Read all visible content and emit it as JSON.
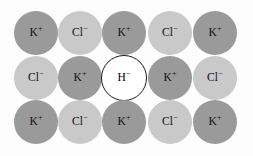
{
  "figure": {
    "width": 253,
    "height": 156,
    "background_color": "#fdfdfd"
  },
  "colors": {
    "cation_fill": "#9a9a9a",
    "anion_fill": "#c9c9c9",
    "defect_fill": "#ffffff",
    "defect_stroke": "#1a1a1a",
    "label_color": "#111111"
  },
  "species": {
    "potassium": {
      "symbol": "K",
      "charge": "+",
      "kind": "cation"
    },
    "chloride": {
      "symbol": "Cl",
      "charge": "−",
      "kind": "anion"
    },
    "hydride": {
      "symbol": "H",
      "charge": "−",
      "kind": "defect"
    }
  },
  "lattice": {
    "rows": 3,
    "columns": 5,
    "radius": 22,
    "defect_radius": 23,
    "ions": [
      {
        "id": "r1c1",
        "symbol": "K",
        "charge": "+",
        "kind": "cation",
        "cx": 36,
        "cy": 33,
        "r": 22
      },
      {
        "id": "r1c2",
        "symbol": "Cl",
        "charge": "−",
        "kind": "anion",
        "cx": 80,
        "cy": 33,
        "r": 22
      },
      {
        "id": "r1c3",
        "symbol": "K",
        "charge": "+",
        "kind": "cation",
        "cx": 124,
        "cy": 33,
        "r": 22
      },
      {
        "id": "r1c4",
        "symbol": "Cl",
        "charge": "−",
        "kind": "anion",
        "cx": 170,
        "cy": 33,
        "r": 22
      },
      {
        "id": "r1c5",
        "symbol": "K",
        "charge": "+",
        "kind": "cation",
        "cx": 215,
        "cy": 33,
        "r": 22
      },
      {
        "id": "r2c1",
        "symbol": "Cl",
        "charge": "−",
        "kind": "anion",
        "cx": 36,
        "cy": 78,
        "r": 22
      },
      {
        "id": "r2c2",
        "symbol": "K",
        "charge": "+",
        "kind": "cation",
        "cx": 80,
        "cy": 78,
        "r": 22
      },
      {
        "id": "r2c3",
        "symbol": "H",
        "charge": "−",
        "kind": "defect",
        "cx": 124,
        "cy": 78,
        "r": 23
      },
      {
        "id": "r2c4",
        "symbol": "K",
        "charge": "+",
        "kind": "cation",
        "cx": 170,
        "cy": 78,
        "r": 22
      },
      {
        "id": "r2c5",
        "symbol": "Cl",
        "charge": "−",
        "kind": "anion",
        "cx": 215,
        "cy": 78,
        "r": 22
      },
      {
        "id": "r3c1",
        "symbol": "K",
        "charge": "+",
        "kind": "cation",
        "cx": 36,
        "cy": 122,
        "r": 22
      },
      {
        "id": "r3c2",
        "symbol": "Cl",
        "charge": "−",
        "kind": "anion",
        "cx": 80,
        "cy": 122,
        "r": 22
      },
      {
        "id": "r3c3",
        "symbol": "K",
        "charge": "+",
        "kind": "cation",
        "cx": 124,
        "cy": 122,
        "r": 22
      },
      {
        "id": "r3c4",
        "symbol": "Cl",
        "charge": "−",
        "kind": "anion",
        "cx": 170,
        "cy": 122,
        "r": 22
      },
      {
        "id": "r3c5",
        "symbol": "K",
        "charge": "+",
        "kind": "cation",
        "cx": 215,
        "cy": 122,
        "r": 22
      }
    ]
  }
}
